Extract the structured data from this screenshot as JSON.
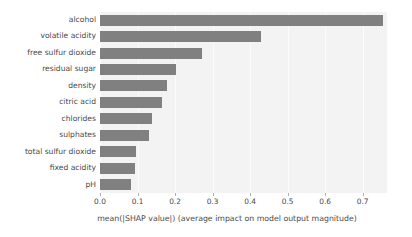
{
  "chart_data": {
    "type": "bar",
    "orientation": "horizontal",
    "title": "",
    "xlabel": "mean(|SHAP value|) (average impact on model output magnitude)",
    "ylabel": "",
    "categories": [
      "alcohol",
      "volatile acidity",
      "free sulfur dioxide",
      "residual sugar",
      "density",
      "citric acid",
      "chlorides",
      "sulphates",
      "total sulfur dioxide",
      "fixed acidity",
      "pH"
    ],
    "values": [
      0.755,
      0.43,
      0.272,
      0.203,
      0.178,
      0.165,
      0.139,
      0.131,
      0.095,
      0.093,
      0.083
    ],
    "xlim": [
      0.0,
      0.765
    ],
    "ylim": [
      0,
      11
    ],
    "xticks": [
      0.0,
      0.1,
      0.2,
      0.3,
      0.4,
      0.5,
      0.6,
      0.7
    ],
    "xtick_labels": [
      "0.0",
      "0.1",
      "0.2",
      "0.3",
      "0.4",
      "0.5",
      "0.6",
      "0.7"
    ],
    "grid": true,
    "legend": null,
    "bar_color": "#808080",
    "plot_background": "#f3f3f3",
    "figure_background": "#ffffff",
    "text_color": "#4a4a4a"
  }
}
